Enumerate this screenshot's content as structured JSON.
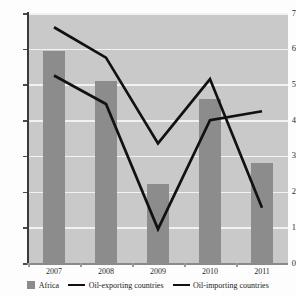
{
  "chart_data": {
    "type": "bar",
    "title": "",
    "subtitle": "",
    "xlabel": "",
    "ylabel": "",
    "categories": [
      "2007",
      "2008",
      "2009",
      "2010",
      "2011"
    ],
    "ylim": [
      0,
      7
    ],
    "y_ticks": [
      0,
      1,
      2,
      3,
      4,
      5,
      6,
      7
    ],
    "y_tick_labels": [
      "0",
      "1",
      "2",
      "3",
      "4",
      "5",
      "6",
      "7"
    ],
    "grid": true,
    "grid_axis": "y",
    "legend_position": "bottom",
    "series": [
      {
        "name": "Africa",
        "type": "bar",
        "color": "#8c8c8c",
        "values": [
          5.95,
          5.1,
          2.2,
          4.6,
          2.8
        ]
      },
      {
        "name": "Oil-exporting countries",
        "type": "line",
        "color": "#111111",
        "values": [
          6.6,
          5.75,
          3.35,
          5.15,
          1.55
        ]
      },
      {
        "name": "Oil-importing countries",
        "type": "line",
        "color": "#111111",
        "values": [
          5.25,
          4.45,
          0.95,
          4.0,
          4.25
        ]
      }
    ]
  },
  "legend": {
    "items": [
      {
        "label": "Africa",
        "marker": "square-swatch"
      },
      {
        "label": "Oil-exporting countries",
        "marker": "line-swatch"
      },
      {
        "label": "Oil-importing countries",
        "marker": "line-swatch"
      }
    ]
  }
}
